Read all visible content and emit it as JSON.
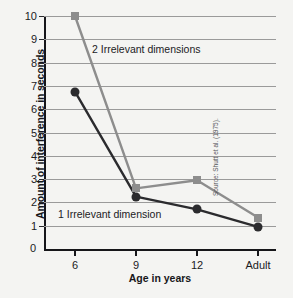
{
  "chart_data": {
    "type": "line",
    "title": "",
    "xlabel": "Age in years",
    "ylabel": "Amount of interference in seconds",
    "categories": [
      "6",
      "9",
      "12",
      "Adult"
    ],
    "ylim": [
      0,
      10
    ],
    "yticks": [
      "0",
      "1",
      "2",
      "3",
      "4",
      "5",
      "6",
      "7",
      "8",
      "9",
      "10"
    ],
    "grid": true,
    "legend_position": "inline-annotations",
    "series": [
      {
        "name": "2 Irrelevant dimensions",
        "values": [
          10.0,
          2.6,
          2.95,
          1.35
        ],
        "color": "#8d8d8d",
        "marker": "square"
      },
      {
        "name": "1 Irrelevant dimension",
        "values": [
          6.75,
          2.25,
          1.7,
          0.95
        ],
        "color": "#2b2b2e",
        "marker": "circle"
      }
    ],
    "annotations": [
      {
        "text": "2 Irrelevant dimensions"
      },
      {
        "text": "1 Irrelevant dimension"
      }
    ],
    "source": "Source: Shutt et al. (1975)."
  },
  "axis": {
    "zero_label": "0"
  }
}
